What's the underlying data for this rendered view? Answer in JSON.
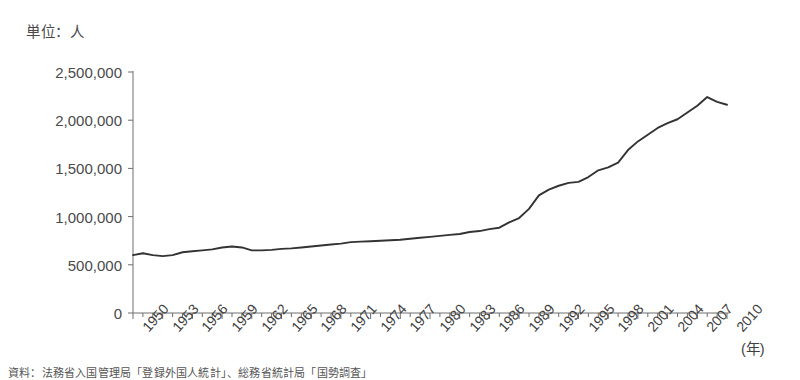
{
  "chart_data": {
    "type": "line",
    "title": "",
    "unit_label": "単位：人",
    "xlabel": "(年)",
    "ylabel": "",
    "xlim": [
      1950,
      2010
    ],
    "ylim": [
      0,
      2500000
    ],
    "grid": false,
    "legend": "none",
    "line_color": "#333333",
    "axis_color": "#6f6f6f",
    "y_ticks": [
      0,
      500000,
      1000000,
      1500000,
      2000000,
      2500000
    ],
    "y_tick_labels": [
      "0",
      "500,000",
      "1,000,000",
      "1,500,000",
      "2,000,000",
      "2,500,000"
    ],
    "x_tick_labels": [
      "1950",
      "1953",
      "1956",
      "1959",
      "1962",
      "1965",
      "1968",
      "1971",
      "1974",
      "1977",
      "1980",
      "1983",
      "1986",
      "1989",
      "1992",
      "1995",
      "1998",
      "2001",
      "2004",
      "2007",
      "2010"
    ],
    "x_minor_tick_interval": 1,
    "x_label_interval": 3,
    "series": [
      {
        "name": "登録外国人数",
        "x": [
          1950,
          1951,
          1952,
          1953,
          1954,
          1955,
          1956,
          1957,
          1958,
          1959,
          1960,
          1961,
          1962,
          1963,
          1964,
          1965,
          1966,
          1967,
          1968,
          1969,
          1970,
          1971,
          1972,
          1973,
          1974,
          1975,
          1976,
          1977,
          1978,
          1979,
          1980,
          1981,
          1982,
          1983,
          1984,
          1985,
          1986,
          1987,
          1988,
          1989,
          1990,
          1991,
          1992,
          1993,
          1994,
          1995,
          1996,
          1997,
          1998,
          1999,
          2000,
          2001,
          2002,
          2003,
          2004,
          2005,
          2006,
          2007,
          2008,
          2009,
          2010
        ],
        "values": [
          600000,
          620000,
          600000,
          590000,
          600000,
          630000,
          640000,
          650000,
          660000,
          680000,
          690000,
          680000,
          650000,
          650000,
          655000,
          665000,
          670000,
          680000,
          690000,
          700000,
          710000,
          720000,
          735000,
          740000,
          745000,
          750000,
          755000,
          760000,
          770000,
          780000,
          790000,
          800000,
          810000,
          820000,
          840000,
          850000,
          870000,
          885000,
          940000,
          985000,
          1080000,
          1220000,
          1280000,
          1320000,
          1350000,
          1360000,
          1410000,
          1480000,
          1510000,
          1560000,
          1690000,
          1780000,
          1850000,
          1920000,
          1970000,
          2010000,
          2080000,
          2150000,
          2240000,
          2190000,
          2160000
        ]
      }
    ]
  },
  "footnote": {
    "text": "資料：法務省入国管理局「登録外国人統計」、総務省統計局「国勢調査」"
  }
}
